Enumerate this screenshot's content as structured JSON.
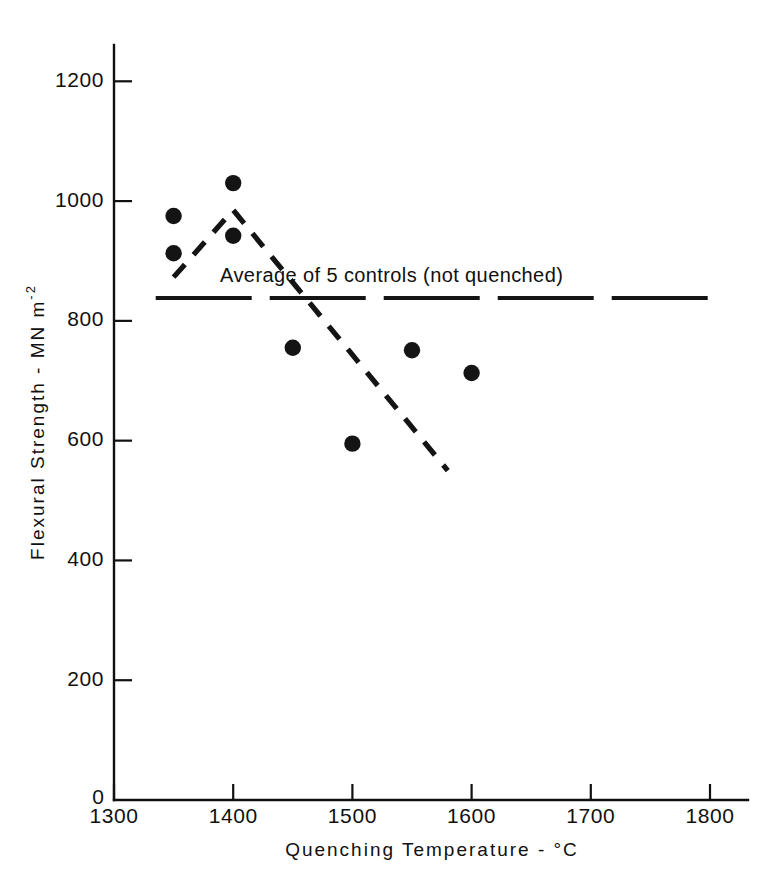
{
  "chart_data": {
    "type": "scatter",
    "title": "",
    "xlabel": "Quenching Temperature - °C",
    "ylabel_main": "Flexural Strength - MN m",
    "ylabel_exponent": "-2",
    "xlim": [
      1300,
      1800
    ],
    "ylim": [
      0,
      1200
    ],
    "grid": false,
    "legend_position": "none",
    "x_ticks": [
      1300,
      1400,
      1500,
      1600,
      1700,
      1800
    ],
    "x_tick_labels": [
      "1300",
      "1400",
      "1500",
      "1600",
      "1700",
      "1800"
    ],
    "y_ticks": [
      0,
      200,
      400,
      600,
      800,
      1000,
      1200
    ],
    "y_tick_labels": [
      "0",
      "200",
      "400",
      "600",
      "800",
      "1000",
      "1200"
    ],
    "series": [
      {
        "name": "Quenched specimens",
        "type": "scatter",
        "marker": "filled-circle",
        "color": "#141414",
        "points": [
          {
            "x": 1350,
            "y": 975
          },
          {
            "x": 1350,
            "y": 913
          },
          {
            "x": 1400,
            "y": 1030
          },
          {
            "x": 1400,
            "y": 942
          },
          {
            "x": 1450,
            "y": 755
          },
          {
            "x": 1500,
            "y": 595
          },
          {
            "x": 1550,
            "y": 751
          },
          {
            "x": 1600,
            "y": 713
          }
        ]
      },
      {
        "name": "Trend line",
        "type": "line",
        "style": "dashed",
        "color": "#141414",
        "points": [
          {
            "x": 1350,
            "y": 873
          },
          {
            "x": 1400,
            "y": 985
          },
          {
            "x": 1580,
            "y": 550
          }
        ]
      },
      {
        "name": "Average of 5 controls (not quenched)",
        "type": "hline",
        "style": "long-dashed",
        "color": "#141414",
        "value": 838,
        "x_start": 1335,
        "x_end": 1800
      }
    ],
    "annotations": [
      {
        "text": "Average of 5 controls (not quenched)",
        "x": 1540,
        "y": 865
      }
    ]
  }
}
